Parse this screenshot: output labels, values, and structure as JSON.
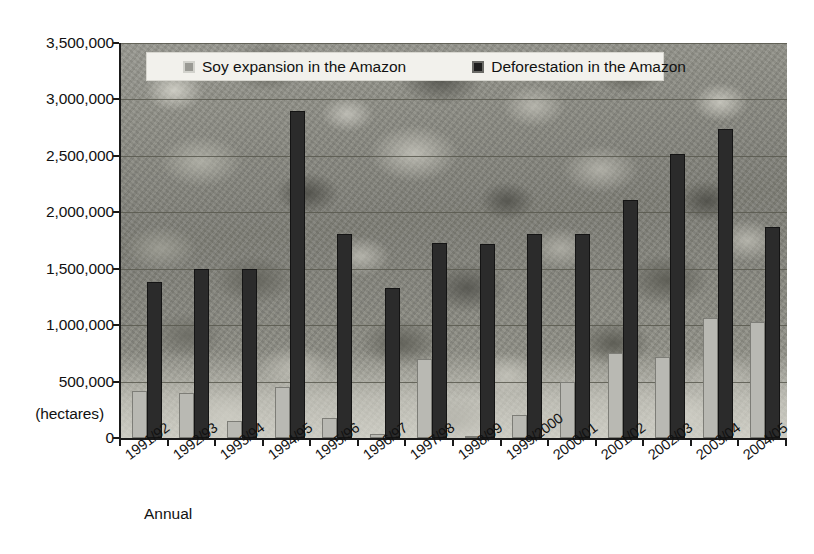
{
  "chart_data": {
    "type": "bar",
    "title": "",
    "subtitle": "",
    "xlabel": "Annual",
    "ylabel": "(hectares)",
    "ylim": [
      0,
      3500000
    ],
    "ytick_step": 500000,
    "grid": true,
    "legend_position": "top-inside",
    "bar_layout": "grouped",
    "categories": [
      "1991/92",
      "1992/93",
      "1993/94",
      "1994/95",
      "1995/96",
      "1996/97",
      "1997/98",
      "1998/99",
      "1999/2000",
      "2000/01",
      "2001/02",
      "2002/03",
      "2003/04",
      "2004/05"
    ],
    "ytick_labels": [
      "0",
      "500,000",
      "1,000,000",
      "1,500,000",
      "2,000,000",
      "2,500,000",
      "3,000,000",
      "3,500,000"
    ],
    "ytick_values": [
      0,
      500000,
      1000000,
      1500000,
      2000000,
      2500000,
      3000000,
      3500000
    ],
    "series": [
      {
        "name": "Soy expansion in the Amazon",
        "color": "#b9b9b3",
        "values": [
          420000,
          400000,
          150000,
          450000,
          180000,
          40000,
          700000,
          10000,
          200000,
          500000,
          750000,
          720000,
          1060000,
          1030000
        ]
      },
      {
        "name": "Deforestation in the Amazon",
        "color": "#2b2b2b",
        "values": [
          1380000,
          1500000,
          1500000,
          2900000,
          1810000,
          1330000,
          1730000,
          1720000,
          1810000,
          1810000,
          2110000,
          2520000,
          2740000,
          1870000
        ]
      }
    ]
  },
  "legend": {
    "items": [
      {
        "label": "Soy expansion in the Amazon",
        "swatch": "soy-legend-swatch"
      },
      {
        "label": "Deforestation in the Amazon",
        "swatch": "deforestation-legend-swatch"
      }
    ]
  },
  "axis": {
    "y_unit_label": "(hectares)",
    "x_axis_caption": "Annual"
  }
}
